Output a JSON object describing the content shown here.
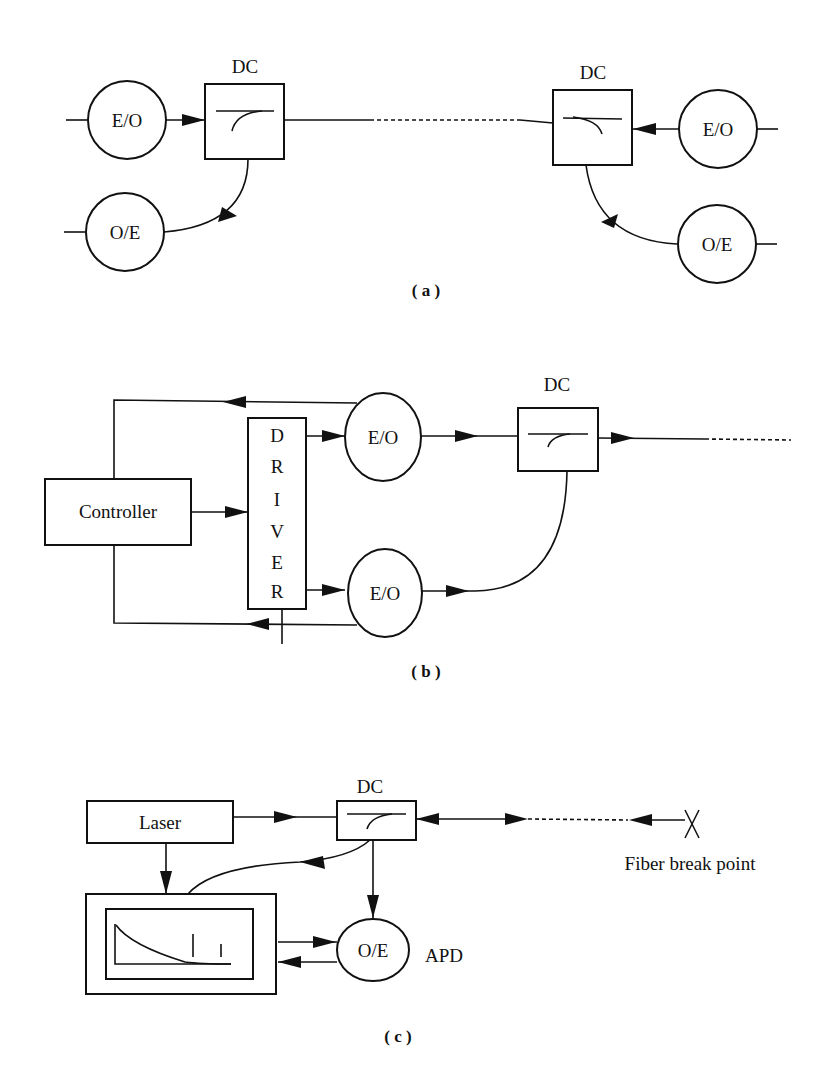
{
  "panel_a": {
    "caption": "( a )",
    "left": {
      "dc_label": "DC",
      "eo_label": "E/O",
      "oe_label": "O/E"
    },
    "right": {
      "dc_label": "DC",
      "eo_label": "E/O",
      "oe_label": "O/E"
    }
  },
  "panel_b": {
    "caption": "( b )",
    "controller_label": "Controller",
    "driver_letters": [
      "D",
      "R",
      "I",
      "V",
      "E",
      "R"
    ],
    "eo_top_label": "E/O",
    "eo_bottom_label": "E/O",
    "dc_label": "DC"
  },
  "panel_c": {
    "caption": "( c )",
    "laser_label": "Laser",
    "dc_label": "DC",
    "oe_label": "O/E",
    "apd_label": "APD",
    "fiber_break_label": "Fiber  break  point",
    "break_marker": "X"
  },
  "colors": {
    "ink": "#111111",
    "background": "#ffffff"
  }
}
